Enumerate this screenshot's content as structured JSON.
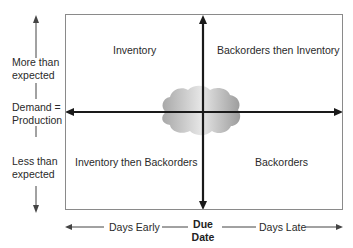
{
  "quadrants": {
    "top_left": "Inventory",
    "top_right": "Backorders then Inventory",
    "bottom_left": "Inventory then Backorders",
    "bottom_right": "Backorders"
  },
  "y_axis": {
    "top_line1": "More than",
    "top_line2": "expected",
    "middle_line1": "Demand =",
    "middle_line2": "Production",
    "bottom_line1": "Less than",
    "bottom_line2": "expected"
  },
  "x_axis": {
    "left": "Days Early",
    "center_line1": "Due",
    "center_line2": "Date",
    "right": "Days Late"
  },
  "colors": {
    "axis": "#1a1a1a",
    "border": "#8a8a8a",
    "cloud_light": "#e8e8e8",
    "cloud_dark": "#9a9a9a"
  }
}
